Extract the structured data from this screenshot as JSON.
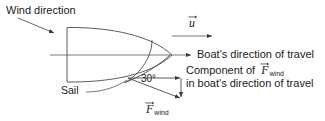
{
  "figure": {
    "type": "physics-vector-diagram",
    "background_color": "#ffffff",
    "line_color": "#444444",
    "text_color": "#1a1a1a",
    "width": 325,
    "height": 121
  },
  "labels": {
    "wind_direction": "Wind direction",
    "boat_direction_of_travel": "Boat's direction of travel",
    "component_line1_prefix": "Component of",
    "component_line2": "in boat's direction of travel",
    "sail": "Sail",
    "angle": "30°",
    "angle_value": 30,
    "angle_unit": "degrees"
  },
  "symbols": {
    "velocity": {
      "letter": "u",
      "subscript": "",
      "has_vector_arrow": true,
      "name": "u-vector"
    },
    "force_component": {
      "letter": "F",
      "subscript": "wind",
      "has_vector_arrow": true,
      "name": "F-wind-vector"
    },
    "force_bottom": {
      "letter": "F",
      "subscript": "wind",
      "has_vector_arrow": true,
      "name": "F-wind-vector"
    }
  },
  "geometry": {
    "hull": {
      "stern_x": 67,
      "stern_top_y": 27,
      "stern_bottom_y": 82,
      "bow_x": 172,
      "bow_y": 55
    },
    "centerline": {
      "x1": 50,
      "y1": 55,
      "x2": 192,
      "y2": 55
    },
    "wind_arrow": {
      "x1": 18,
      "y1": 18,
      "x2": 56,
      "y2": 34
    },
    "velocity_arrow": {
      "x1": 172,
      "y1": 36,
      "x2": 213,
      "y2": 36
    },
    "force_arrow": {
      "x1": 128,
      "y1": 78,
      "x2": 182,
      "y2": 99
    },
    "component_arrow": {
      "x1": 128,
      "y1": 78,
      "x2": 181,
      "y2": 78
    },
    "projection_drop": {
      "x1": 181,
      "y1": 78,
      "x2": 181,
      "y2": 99
    }
  }
}
